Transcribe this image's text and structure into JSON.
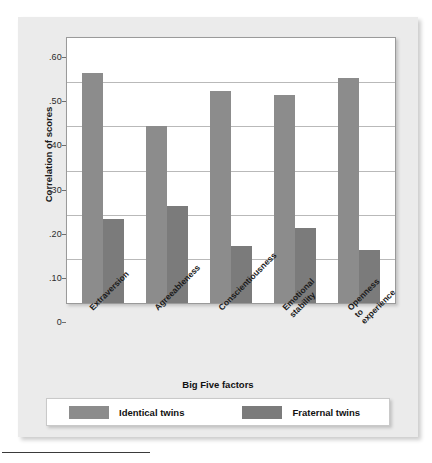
{
  "chart_data": {
    "type": "bar",
    "title": "",
    "xlabel": "Big Five factors",
    "ylabel": "Correlation of scores",
    "categories": [
      "Extraversion",
      "Agreeableness",
      "Conscientiousness",
      "Emotional stability",
      "Openness to experience"
    ],
    "category_lines": [
      [
        "Extraversion"
      ],
      [
        "Agreeableness"
      ],
      [
        "Conscientiousness"
      ],
      [
        "Emotional",
        "stability"
      ],
      [
        "Openness",
        "to",
        "experience"
      ]
    ],
    "series": [
      {
        "name": "Identical twins",
        "color": "#8c8c8c",
        "values": [
          0.52,
          0.4,
          0.48,
          0.47,
          0.51
        ]
      },
      {
        "name": "Fraternal twins",
        "color": "#7b7b7b",
        "values": [
          0.19,
          0.22,
          0.13,
          0.17,
          0.12
        ]
      }
    ],
    "ylim": [
      0,
      0.6
    ],
    "ytick_values": [
      0,
      0.1,
      0.2,
      0.3,
      0.4,
      0.5,
      0.6
    ],
    "ytick_labels": [
      "0",
      ".10",
      ".20",
      ".30",
      ".40",
      ".50",
      ".60"
    ],
    "grid": true,
    "legend_position": "bottom"
  },
  "legend": {
    "items": [
      {
        "label": "Identical twins",
        "color": "#8c8c8c"
      },
      {
        "label": "Fraternal twins",
        "color": "#7b7b7b"
      }
    ]
  },
  "axes": {
    "y_title": "Correlation of scores",
    "x_title": "Big Five factors"
  }
}
